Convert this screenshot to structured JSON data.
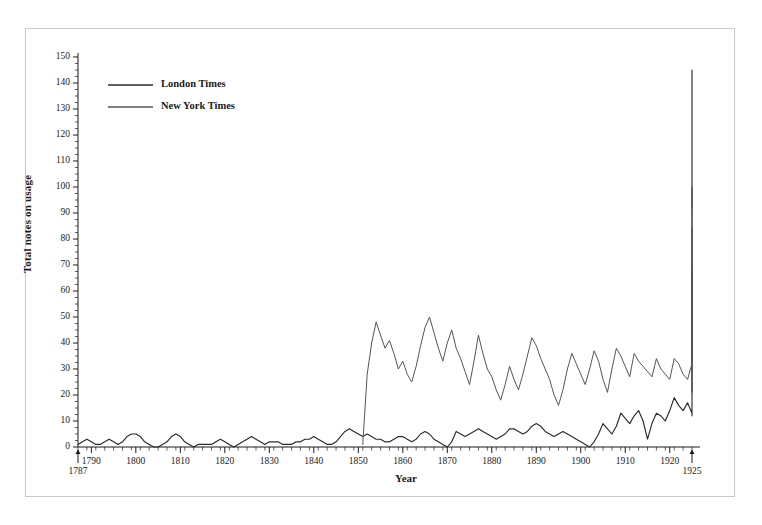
{
  "chart_data": {
    "type": "line",
    "title": "",
    "xlabel": "Year",
    "ylabel": "Total notes on usage",
    "xlim": [
      1787,
      1925
    ],
    "ylim": [
      0,
      150
    ],
    "grid": false,
    "legend_position": "top-left",
    "x_axis": {
      "start_label": "1787",
      "end_label": "1925",
      "tick_interval": 2,
      "label_interval": 10,
      "tick_labels": [
        "1790",
        "1800",
        "1810",
        "1820",
        "1830",
        "1840",
        "1850",
        "1860",
        "1870",
        "1880",
        "1890",
        "1900",
        "1910",
        "1920"
      ],
      "tick_values": [
        1790,
        1800,
        1810,
        1820,
        1830,
        1840,
        1850,
        1860,
        1870,
        1880,
        1890,
        1900,
        1910,
        1920
      ]
    },
    "y_axis": {
      "tick_labels": [
        "0",
        "10",
        "20",
        "30",
        "40",
        "50",
        "60",
        "70",
        "80",
        "90",
        "100",
        "110",
        "120",
        "130",
        "140",
        "150"
      ],
      "tick_values": [
        0,
        10,
        20,
        30,
        40,
        50,
        60,
        70,
        80,
        90,
        100,
        110,
        120,
        130,
        140,
        150
      ],
      "minor_tick_interval": 2.5
    },
    "series": [
      {
        "name": "London Times",
        "color": "#2b2b2b",
        "x_start": 1787,
        "values": [
          1,
          2,
          3,
          2,
          1,
          1,
          2,
          3,
          2,
          1,
          2,
          4,
          5,
          5,
          4,
          2,
          1,
          0,
          0,
          1,
          2,
          4,
          5,
          4,
          2,
          1,
          0,
          1,
          1,
          1,
          1,
          2,
          3,
          2,
          1,
          0,
          1,
          2,
          3,
          4,
          3,
          2,
          1,
          2,
          2,
          2,
          1,
          1,
          1,
          2,
          2,
          3,
          3,
          4,
          3,
          2,
          1,
          1,
          2,
          4,
          6,
          7,
          6,
          5,
          4,
          5,
          4,
          3,
          3,
          2,
          2,
          3,
          4,
          4,
          3,
          2,
          3,
          5,
          6,
          5,
          3,
          2,
          1,
          0,
          2,
          6,
          5,
          4,
          5,
          6,
          7,
          6,
          5,
          4,
          3,
          4,
          5,
          7,
          7,
          6,
          5,
          6,
          8,
          9,
          8,
          6,
          5,
          4,
          5,
          6,
          5,
          4,
          3,
          2,
          1,
          0,
          2,
          5,
          9,
          7,
          5,
          8,
          13,
          11,
          9,
          12,
          14,
          10,
          3,
          9,
          13,
          12,
          10,
          14,
          19,
          16,
          14,
          17,
          13,
          12,
          15,
          21,
          18,
          16,
          20,
          24,
          22,
          18,
          24,
          25,
          24,
          24,
          25,
          24,
          25,
          25,
          24,
          25,
          26,
          24,
          33,
          40,
          46,
          42,
          36,
          44,
          52,
          44,
          38,
          46,
          41,
          33,
          40,
          44,
          38,
          34,
          42,
          36,
          31,
          38,
          44,
          40,
          36,
          33,
          43,
          50,
          44,
          38,
          34,
          40,
          46,
          52,
          58,
          64,
          60,
          56,
          52,
          58,
          62,
          57,
          55,
          58,
          54,
          57,
          61,
          67,
          63,
          58,
          54,
          62,
          66,
          61,
          57,
          53,
          61,
          64,
          58,
          52,
          45,
          29,
          46,
          55,
          63,
          58,
          52,
          56,
          60,
          55,
          50,
          43,
          37,
          44,
          55,
          62,
          57,
          50,
          44,
          52,
          60,
          66,
          58,
          52,
          60,
          72,
          78,
          85,
          91,
          80,
          68,
          62,
          56,
          60,
          68,
          76,
          84,
          92,
          100,
          105,
          97,
          88,
          82,
          90,
          94,
          88,
          83,
          95,
          103,
          112,
          104,
          96,
          90,
          82,
          76,
          70,
          64,
          74,
          88,
          100,
          112,
          125,
          138,
          144,
          110,
          80,
          60,
          48,
          52,
          62,
          76,
          90,
          105,
          118,
          130,
          140,
          145
        ]
      },
      {
        "name": "New York Times",
        "color": "#555555",
        "x_start": 1851,
        "values": [
          1,
          28,
          40,
          48,
          43,
          38,
          41,
          36,
          30,
          33,
          28,
          25,
          31,
          39,
          46,
          50,
          44,
          38,
          33,
          40,
          45,
          38,
          34,
          29,
          24,
          33,
          43,
          36,
          30,
          27,
          22,
          18,
          24,
          31,
          26,
          22,
          28,
          35,
          42,
          39,
          34,
          30,
          26,
          20,
          16,
          22,
          30,
          36,
          32,
          28,
          24,
          30,
          37,
          33,
          26,
          21,
          30,
          38,
          35,
          31,
          27,
          36,
          33,
          31,
          29,
          27,
          34,
          30,
          28,
          26,
          34,
          32,
          28,
          26,
          32,
          38,
          42,
          40,
          36,
          33,
          38,
          44,
          50,
          46,
          42,
          40,
          45,
          52,
          48,
          44,
          40,
          38,
          44,
          50,
          55,
          50,
          45,
          42,
          48,
          54,
          50,
          46,
          42,
          38,
          34,
          30,
          25,
          21,
          26,
          35,
          44,
          50,
          56,
          62,
          68,
          64,
          58,
          52,
          48,
          44,
          40,
          44,
          50,
          56,
          62,
          58,
          54,
          48,
          42,
          38,
          34,
          40,
          48,
          56,
          62,
          66,
          60,
          54,
          48,
          44,
          40,
          36,
          38,
          44,
          52,
          60,
          66,
          64,
          58,
          52,
          46,
          40,
          34,
          38,
          46,
          54,
          62,
          68,
          64,
          58,
          52,
          46,
          42,
          48,
          56,
          64,
          68,
          62,
          56,
          48,
          42,
          36,
          34,
          40,
          48,
          56,
          62,
          58,
          52,
          46,
          50,
          58,
          64,
          60,
          55,
          50,
          54,
          60,
          66,
          62,
          56,
          50,
          46,
          52,
          60,
          68,
          62,
          56,
          50,
          44,
          40,
          46,
          54,
          62,
          68,
          64,
          58,
          50,
          44,
          38,
          34,
          42,
          52,
          60,
          56,
          50,
          46,
          52,
          60,
          67,
          62,
          55,
          48,
          42,
          36,
          34,
          40,
          50,
          62,
          72,
          78,
          84,
          80,
          72,
          64,
          56,
          48,
          42,
          38,
          34,
          44,
          58,
          70,
          82,
          94,
          100,
          92
        ]
      }
    ]
  },
  "legend": {
    "entries": [
      {
        "label": "London Times",
        "color": "#2b2b2b"
      },
      {
        "label": "New York Times",
        "color": "#555555"
      }
    ]
  }
}
